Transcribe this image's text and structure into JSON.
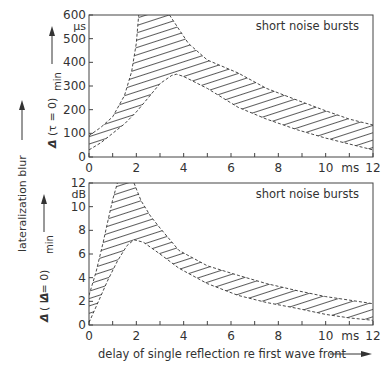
{
  "figure": {
    "shared_ylabel": "lateralization blur",
    "xlabel": "delay of single reflection re first wave front",
    "x_unit": "ms"
  },
  "chart_data": [
    {
      "type": "area",
      "title": "",
      "annotation": "short noise bursts",
      "xlabel": "delay of single reflection re first wave front",
      "ylabel": "Δ (τ = 0)min",
      "y_unit": "µs",
      "x_unit": "ms",
      "xlim": [
        0,
        12
      ],
      "ylim": [
        0,
        600
      ],
      "xticks": [
        0,
        2,
        4,
        6,
        8,
        10,
        12
      ],
      "xtick_labels": [
        "0",
        "2",
        "4",
        "6",
        "8",
        "10",
        "12"
      ],
      "yticks": [
        0,
        100,
        200,
        300,
        400,
        500,
        600
      ],
      "ytick_labels": [
        "0",
        "100",
        "200",
        "300",
        "400",
        "500",
        "600"
      ],
      "grid": false,
      "fill": "hatched band between upper and lower bounds",
      "series": [
        {
          "name": "upper bound (rising branch)",
          "x": [
            0,
            0.5,
            1.0,
            1.5,
            1.8,
            2.0,
            2.1
          ],
          "values": [
            90,
            125,
            170,
            260,
            360,
            480,
            600
          ]
        },
        {
          "name": "upper bound (falling branch)",
          "x": [
            3.4,
            3.6,
            3.8,
            4.2,
            5.0,
            6.3,
            7.5,
            8.8,
            10.0,
            11.0,
            12.0
          ],
          "values": [
            600,
            570,
            540,
            480,
            410,
            355,
            290,
            240,
            195,
            160,
            135
          ]
        },
        {
          "name": "lower bound",
          "x": [
            0,
            0.5,
            1.0,
            1.5,
            2.0,
            2.5,
            3.0,
            3.5,
            3.7,
            4.0,
            5.0,
            6.3,
            7.5,
            8.8,
            10.0,
            11.0,
            12.0
          ],
          "values": [
            30,
            60,
            100,
            140,
            190,
            250,
            310,
            345,
            350,
            340,
            290,
            210,
            160,
            115,
            80,
            55,
            30
          ]
        }
      ]
    },
    {
      "type": "area",
      "title": "",
      "annotation": "short noise bursts",
      "xlabel": "delay of single reflection re first wave front",
      "ylabel": "Δ (ΔL = 0)min",
      "y_unit": "dB",
      "x_unit": "ms",
      "xlim": [
        0,
        12
      ],
      "ylim": [
        0,
        12
      ],
      "xticks": [
        0,
        2,
        4,
        6,
        8,
        10,
        12
      ],
      "xtick_labels": [
        "0",
        "2",
        "4",
        "6",
        "8",
        "10",
        "12"
      ],
      "yticks": [
        0,
        2,
        4,
        6,
        8,
        10,
        12
      ],
      "ytick_labels": [
        "0",
        "2",
        "4",
        "6",
        "8",
        "10",
        "12"
      ],
      "grid": false,
      "fill": "hatched band between upper and lower bounds",
      "series": [
        {
          "name": "upper bound (rising branch)",
          "x": [
            0,
            0.3,
            0.6,
            0.8,
            1.0,
            1.2
          ],
          "values": [
            2.5,
            4.5,
            7.0,
            8.8,
            10.6,
            12.0
          ]
        },
        {
          "name": "upper bound (falling branch)",
          "x": [
            1.9,
            2.2,
            2.6,
            3.0,
            3.8,
            5.0,
            6.3,
            7.5,
            8.8,
            10.0,
            11.0,
            12.0
          ],
          "values": [
            12.0,
            10.5,
            9.2,
            8.2,
            6.3,
            5.0,
            4.2,
            3.5,
            2.9,
            2.4,
            2.1,
            1.8
          ]
        },
        {
          "name": "lower bound",
          "x": [
            0,
            0.4,
            0.8,
            1.2,
            1.6,
            1.9,
            2.3,
            3.0,
            3.8,
            5.0,
            6.3,
            7.5,
            8.8,
            10.0,
            11.0,
            12.0
          ],
          "values": [
            0.2,
            2.0,
            3.8,
            5.4,
            6.7,
            7.2,
            7.0,
            6.0,
            4.8,
            3.5,
            2.5,
            1.9,
            1.4,
            0.9,
            0.6,
            0.4
          ]
        }
      ]
    }
  ],
  "layout": {
    "plots": [
      {
        "left": 89,
        "right": 373,
        "top": 15,
        "bottom": 157
      },
      {
        "left": 89,
        "right": 373,
        "top": 183,
        "bottom": 325
      }
    ]
  }
}
